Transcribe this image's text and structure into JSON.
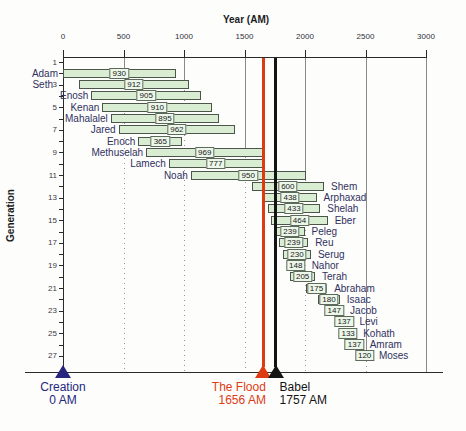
{
  "chart_data": {
    "type": "bar",
    "xlabel": "Year (AM)",
    "ylabel": "Generation",
    "xlim": [
      0,
      3000
    ],
    "x_ticks": [
      "0",
      "500",
      "1000",
      "1500",
      "2000",
      "2500",
      "3000"
    ],
    "y_tick_labels": [
      1,
      3,
      5,
      7,
      9,
      11,
      13,
      15,
      17,
      19,
      21,
      23,
      25,
      27
    ],
    "y_max_generation": 27,
    "grid": "vertical gridlines every 500, dotted below bars",
    "legend": "none",
    "bar_fill": "#d9edd3",
    "bar_border": "#4c554a",
    "people": [
      {
        "generation": 1,
        "name": "Adam",
        "birth_am": 0,
        "lifespan": 930,
        "label_side": "left"
      },
      {
        "generation": 2,
        "name": "Seth",
        "birth_am": 130,
        "lifespan": 912,
        "label_side": "left"
      },
      {
        "generation": 3,
        "name": "Enosh",
        "birth_am": 235,
        "lifespan": 905,
        "label_side": "left"
      },
      {
        "generation": 4,
        "name": "Kenan",
        "birth_am": 325,
        "lifespan": 910,
        "label_side": "left"
      },
      {
        "generation": 5,
        "name": "Mahalalel",
        "birth_am": 395,
        "lifespan": 895,
        "label_side": "left"
      },
      {
        "generation": 6,
        "name": "Jared",
        "birth_am": 460,
        "lifespan": 962,
        "label_side": "left"
      },
      {
        "generation": 7,
        "name": "Enoch",
        "birth_am": 622,
        "lifespan": 365,
        "label_side": "left"
      },
      {
        "generation": 8,
        "name": "Methuselah",
        "birth_am": 687,
        "lifespan": 969,
        "label_side": "left"
      },
      {
        "generation": 9,
        "name": "Lamech",
        "birth_am": 874,
        "lifespan": 777,
        "label_side": "left"
      },
      {
        "generation": 10,
        "name": "Noah",
        "birth_am": 1056,
        "lifespan": 950,
        "label_side": "left"
      },
      {
        "generation": 11,
        "name": "Shem",
        "birth_am": 1558,
        "lifespan": 600,
        "label_side": "right"
      },
      {
        "generation": 12,
        "name": "Arphaxad",
        "birth_am": 1658,
        "lifespan": 438,
        "label_side": "right"
      },
      {
        "generation": 13,
        "name": "Shelah",
        "birth_am": 1693,
        "lifespan": 433,
        "label_side": "right"
      },
      {
        "generation": 14,
        "name": "Eber",
        "birth_am": 1723,
        "lifespan": 464,
        "label_side": "right"
      },
      {
        "generation": 15,
        "name": "Peleg",
        "birth_am": 1757,
        "lifespan": 239,
        "label_side": "right"
      },
      {
        "generation": 16,
        "name": "Reu",
        "birth_am": 1787,
        "lifespan": 239,
        "label_side": "right"
      },
      {
        "generation": 17,
        "name": "Serug",
        "birth_am": 1819,
        "lifespan": 230,
        "label_side": "right"
      },
      {
        "generation": 18,
        "name": "Nahor",
        "birth_am": 1849,
        "lifespan": 148,
        "label_side": "right"
      },
      {
        "generation": 19,
        "name": "Terah",
        "birth_am": 1878,
        "lifespan": 205,
        "label_side": "right"
      },
      {
        "generation": 20,
        "name": "Abraham",
        "birth_am": 2008,
        "lifespan": 175,
        "label_side": "right"
      },
      {
        "generation": 21,
        "name": "Isaac",
        "birth_am": 2108,
        "lifespan": 180,
        "label_side": "right"
      },
      {
        "generation": 22,
        "name": "Jacob",
        "birth_am": 2168,
        "lifespan": 147,
        "label_side": "right"
      },
      {
        "generation": 23,
        "name": "Levi",
        "birth_am": 2255,
        "lifespan": 137,
        "label_side": "right"
      },
      {
        "generation": 24,
        "name": "Kohath",
        "birth_am": 2290,
        "lifespan": 133,
        "label_side": "right"
      },
      {
        "generation": 25,
        "name": "Amram",
        "birth_am": 2340,
        "lifespan": 137,
        "label_side": "right"
      },
      {
        "generation": 26,
        "name": "Moses",
        "birth_am": 2433,
        "lifespan": 120,
        "label_side": "right"
      }
    ],
    "events": [
      {
        "name": "Creation",
        "year": 0,
        "year_label": "0 AM",
        "color": "#26267e",
        "align": "center",
        "has_line": false
      },
      {
        "name": "The Flood",
        "year": 1656,
        "year_label": "1656 AM",
        "color": "#dd3c13",
        "align": "right",
        "has_line": true
      },
      {
        "name": "Babel",
        "year": 1757,
        "year_label": "1757 AM",
        "color": "#141414",
        "align": "left",
        "has_line": true
      }
    ]
  }
}
